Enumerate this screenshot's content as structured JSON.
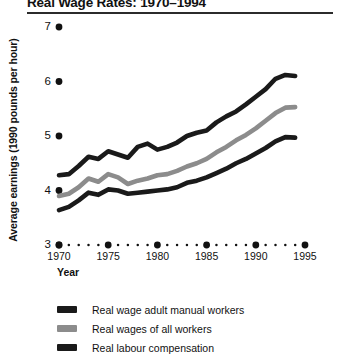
{
  "chart_data": {
    "type": "line",
    "title": "Real Wage Rates: 1970–1994",
    "xlabel": "Year",
    "ylabel": "Average earnings (1990 pounds per hour)",
    "xlim": [
      1970,
      1995
    ],
    "ylim": [
      3,
      7
    ],
    "grid": false,
    "legend_position": "below",
    "x": [
      1970,
      1971,
      1972,
      1973,
      1974,
      1975,
      1976,
      1977,
      1978,
      1979,
      1980,
      1981,
      1982,
      1983,
      1984,
      1985,
      1986,
      1987,
      1988,
      1989,
      1990,
      1991,
      1992,
      1993,
      1994
    ],
    "xticks": [
      1970,
      1975,
      1980,
      1985,
      1990,
      1995
    ],
    "yticks": [
      3,
      4,
      5,
      6,
      7
    ],
    "series": [
      {
        "name": "Real labour compensation",
        "color": "#1a1a1a",
        "values": [
          4.28,
          4.3,
          4.45,
          4.62,
          4.58,
          4.72,
          4.66,
          4.6,
          4.8,
          4.86,
          4.75,
          4.8,
          4.88,
          5.0,
          5.06,
          5.1,
          5.25,
          5.36,
          5.45,
          5.58,
          5.72,
          5.86,
          6.05,
          6.12,
          6.1
        ]
      },
      {
        "name": "Real wages of all workers",
        "color": "#8c8c8c",
        "values": [
          3.9,
          3.94,
          4.06,
          4.22,
          4.16,
          4.3,
          4.24,
          4.12,
          4.18,
          4.22,
          4.28,
          4.3,
          4.36,
          4.44,
          4.5,
          4.58,
          4.7,
          4.8,
          4.92,
          5.02,
          5.14,
          5.28,
          5.42,
          5.52,
          5.53
        ]
      },
      {
        "name": "Real wage adult manual workers",
        "color": "#1a1a1a",
        "values": [
          3.64,
          3.7,
          3.82,
          3.96,
          3.92,
          4.02,
          4.0,
          3.94,
          3.96,
          3.98,
          4.0,
          4.02,
          4.06,
          4.14,
          4.18,
          4.24,
          4.32,
          4.4,
          4.5,
          4.58,
          4.68,
          4.78,
          4.9,
          4.98,
          4.97
        ]
      }
    ],
    "legend": [
      {
        "label": "Real wage adult manual workers",
        "color": "#1a1a1a"
      },
      {
        "label": "Real wages of all workers",
        "color": "#8c8c8c"
      },
      {
        "label": "Real labour compensation",
        "color": "#1a1a1a"
      }
    ]
  }
}
